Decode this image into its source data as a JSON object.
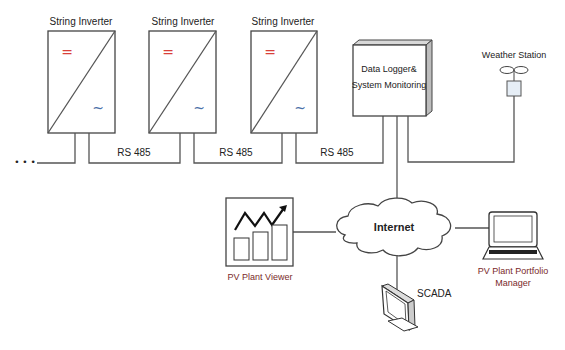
{
  "diagram": {
    "inverters": [
      {
        "label": "String Inverter",
        "dc_symbol": "=",
        "ac_symbol": "~"
      },
      {
        "label": "String Inverter",
        "dc_symbol": "=",
        "ac_symbol": "~"
      },
      {
        "label": "String Inverter",
        "dc_symbol": "=",
        "ac_symbol": "~"
      }
    ],
    "continuation": "• • •",
    "bus_labels": [
      "RS 485",
      "RS 485",
      "RS 485"
    ],
    "data_logger": {
      "line1": "Data Logger&",
      "line2": "System Monitoring"
    },
    "weather_station": {
      "label": "Weather Station"
    },
    "internet": {
      "label": "Internet"
    },
    "pv_plant_viewer": {
      "label": "PV Plant Viewer"
    },
    "scada": {
      "label": "SCADA"
    },
    "portfolio_manager": {
      "line1": "PV Plant Portfolio",
      "line2": "Manager"
    },
    "colors": {
      "dc_symbol": "#d9403a",
      "ac_symbol": "#4a6fa8",
      "client_label": "#7a2a2a"
    }
  }
}
